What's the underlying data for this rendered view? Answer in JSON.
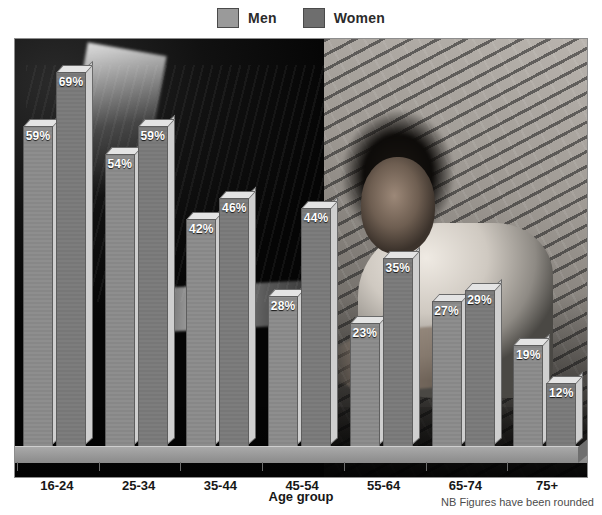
{
  "legend": {
    "items": [
      {
        "label": "Men",
        "color": "#9a9a9a"
      },
      {
        "label": "Women",
        "color": "#6e6e6e"
      }
    ]
  },
  "axis": {
    "xtitle": "Age group"
  },
  "note": "NB Figures have been rounded",
  "background": {
    "description": "black-and-white photo of a young person resting head on arm against a brick wall"
  },
  "chart_data": {
    "type": "bar",
    "title": "",
    "xlabel": "Age group",
    "ylabel": "",
    "ylim": [
      0,
      75
    ],
    "grid": false,
    "legend_position": "top-center",
    "categories": [
      "16-24",
      "25-34",
      "35-44",
      "45-54",
      "55-64",
      "65-74",
      "75+"
    ],
    "series": [
      {
        "name": "Men",
        "color": "#8e8e8e",
        "values": [
          59,
          54,
          42,
          28,
          23,
          27,
          19
        ],
        "labels": [
          "59%",
          "54%",
          "42%",
          "28%",
          "23%",
          "27%",
          "19%"
        ]
      },
      {
        "name": "Women",
        "color": "#7d7d7d",
        "values": [
          69,
          59,
          46,
          44,
          35,
          29,
          12
        ],
        "labels": [
          "69%",
          "59%",
          "46%",
          "44%",
          "35%",
          "29%",
          "12%"
        ]
      }
    ],
    "annotations": [
      "NB Figures have been rounded"
    ]
  }
}
